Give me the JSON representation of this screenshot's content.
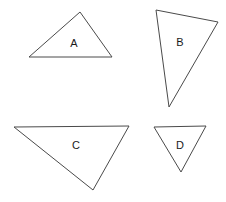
{
  "figure": {
    "background_color": "#ffffff",
    "stroke_color": "#4a4a4a",
    "label_color": "#1a1a1a",
    "width": 226,
    "height": 202,
    "triangles": [
      {
        "label": "A",
        "points": "80,12 112,57 29,57",
        "label_x": 74,
        "label_y": 44
      },
      {
        "label": "B",
        "points": "156,10 218,22 169,107",
        "label_x": 180,
        "label_y": 43
      },
      {
        "label": "C",
        "points": "14,127 129,126 93,190",
        "label_x": 76,
        "label_y": 146
      },
      {
        "label": "D",
        "points": "154,127 206,126 181,172",
        "label_x": 180,
        "label_y": 146
      }
    ]
  }
}
